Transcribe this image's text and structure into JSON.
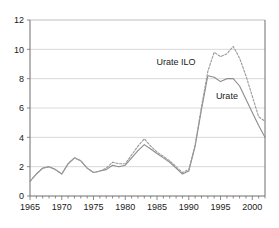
{
  "chart_data": {
    "type": "line",
    "title": "",
    "subtitle": "",
    "xlabel": "",
    "ylabel": "",
    "xlim": [
      1965,
      2002
    ],
    "ylim": [
      0,
      12
    ],
    "grid": true,
    "grid_axis": "y",
    "legend_position": "inline-annotation",
    "y_ticks": [
      0,
      2,
      4,
      6,
      8,
      10,
      12
    ],
    "y_tick_labels": [
      "0",
      "2",
      "4",
      "6",
      "8",
      "10",
      "12"
    ],
    "x_ticks": [
      1965,
      1970,
      1975,
      1980,
      1985,
      1990,
      1995,
      2000
    ],
    "x_tick_labels": [
      "1965",
      "1970",
      "1975",
      "1980",
      "1985",
      "1990",
      "1995",
      "2000"
    ],
    "x_minor_tick_step": 1,
    "x": [
      1965,
      1966,
      1967,
      1968,
      1969,
      1970,
      1971,
      1972,
      1973,
      1974,
      1975,
      1976,
      1977,
      1978,
      1979,
      1980,
      1981,
      1982,
      1983,
      1984,
      1985,
      1986,
      1987,
      1988,
      1989,
      1990,
      1991,
      1992,
      1993,
      1994,
      1995,
      1996,
      1997,
      1998,
      1999,
      2000,
      2001,
      2002
    ],
    "series": [
      {
        "name": "Urate",
        "style": "solid",
        "color": "#8c8c8c",
        "label_x": 1996,
        "label_y": 6.6,
        "values": [
          1.0,
          1.5,
          1.9,
          2.0,
          1.8,
          1.5,
          2.2,
          2.6,
          2.4,
          1.9,
          1.6,
          1.7,
          1.8,
          2.1,
          2.0,
          2.1,
          2.6,
          3.1,
          3.5,
          3.2,
          2.9,
          2.6,
          2.3,
          1.9,
          1.5,
          1.7,
          3.4,
          5.9,
          8.2,
          8.1,
          7.8,
          8.0,
          8.0,
          7.5,
          6.6,
          5.7,
          4.8,
          4.0
        ]
      },
      {
        "name": "Urate ILO",
        "style": "dashed",
        "color": "#9a9a9a",
        "label_x": 1988,
        "label_y": 8.9,
        "values": [
          1.0,
          1.5,
          1.9,
          2.0,
          1.8,
          1.5,
          2.2,
          2.6,
          2.4,
          1.9,
          1.6,
          1.7,
          1.9,
          2.3,
          2.2,
          2.2,
          2.8,
          3.4,
          3.9,
          3.4,
          3.0,
          2.7,
          2.4,
          2.0,
          1.6,
          1.8,
          3.5,
          6.1,
          8.5,
          9.8,
          9.5,
          9.7,
          10.2,
          9.4,
          8.2,
          6.8,
          5.4,
          5.1
        ]
      }
    ]
  },
  "plot_geometry": {
    "left": 30,
    "right": 265,
    "top": 20,
    "bottom": 196
  }
}
